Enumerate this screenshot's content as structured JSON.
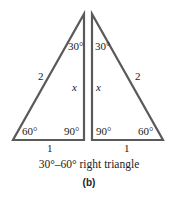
{
  "figure": {
    "panel_label": "(b)",
    "caption": "30°–60° right triangle",
    "line_color": "#5a5a5a",
    "left_triangle": {
      "top_angle": "30°",
      "bottom_left_angle": "60°",
      "bottom_right_angle": "90°",
      "hypotenuse": "2",
      "vertical_side": "x",
      "base": "1"
    },
    "right_triangle": {
      "top_angle": "30°",
      "bottom_left_angle": "90°",
      "bottom_right_angle": "60°",
      "hypotenuse": "2",
      "vertical_side": "x",
      "base": "1"
    }
  }
}
